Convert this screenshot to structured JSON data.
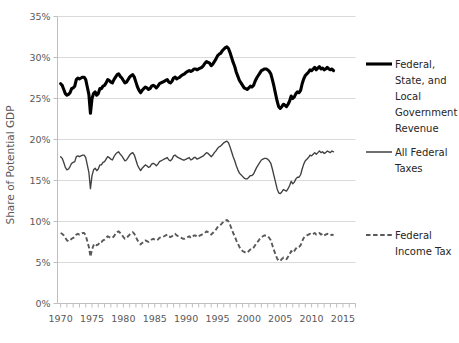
{
  "chart_data": {
    "type": "line",
    "title": "",
    "subtitle": "",
    "xlabel": "",
    "ylabel": "Share of Potential GDP",
    "xlim": [
      1969.5,
      2017.0
    ],
    "ylim": [
      0,
      35
    ],
    "ytick_labels": [
      "0%",
      "5%",
      "10%",
      "15%",
      "20%",
      "25%",
      "30%",
      "35%"
    ],
    "ytick_values": [
      0,
      5,
      10,
      15,
      20,
      25,
      30,
      35
    ],
    "xtick_labels": [
      "1970",
      "1975",
      "1980",
      "1985",
      "1990",
      "1995",
      "2000",
      "2005",
      "2010",
      "2015"
    ],
    "xtick_values": [
      1970,
      1975,
      1980,
      1985,
      1990,
      1995,
      2000,
      2005,
      2010,
      2015
    ],
    "minor_xticks_interval": 1,
    "grid": "horizontal",
    "legend_position": "right",
    "x_start": 1970,
    "x_step": 0.25,
    "series": [
      {
        "name": "Federal, State, and Local Government Revenue",
        "legend_label": "Federal,\nState, and\nLocal\nGovernment\nRevenue",
        "style": "solid-thick",
        "color": "#000000",
        "values": [
          26.8,
          26.6,
          26.1,
          25.6,
          25.4,
          25.5,
          25.7,
          26.2,
          26.3,
          26.5,
          27.3,
          27.5,
          27.4,
          27.5,
          27.6,
          27.6,
          27.3,
          26.4,
          25.5,
          23.2,
          25.0,
          25.6,
          25.8,
          25.4,
          25.6,
          26.2,
          26.2,
          26.5,
          26.6,
          26.9,
          27.3,
          27.2,
          27.0,
          26.9,
          27.3,
          27.6,
          27.9,
          28.0,
          27.7,
          27.5,
          27.2,
          26.9,
          27.0,
          27.3,
          27.6,
          27.8,
          27.9,
          27.6,
          27.0,
          26.4,
          26.0,
          25.7,
          26.0,
          26.2,
          26.4,
          26.3,
          26.1,
          26.2,
          26.5,
          26.6,
          26.5,
          26.3,
          26.5,
          26.8,
          26.9,
          27.0,
          27.1,
          27.2,
          27.3,
          27.0,
          26.9,
          27.1,
          27.5,
          27.6,
          27.4,
          27.5,
          27.6,
          27.8,
          27.9,
          28.0,
          28.2,
          28.3,
          28.4,
          28.3,
          28.4,
          28.6,
          28.6,
          28.5,
          28.6,
          28.7,
          28.8,
          29.0,
          29.3,
          29.5,
          29.4,
          29.3,
          29.0,
          29.2,
          29.5,
          29.8,
          30.2,
          30.4,
          30.5,
          30.8,
          31.0,
          31.2,
          31.3,
          31.1,
          30.6,
          30.0,
          29.4,
          28.9,
          28.2,
          27.7,
          27.2,
          26.9,
          26.6,
          26.3,
          26.2,
          26.1,
          26.3,
          26.5,
          26.4,
          26.6,
          27.1,
          27.5,
          27.8,
          28.1,
          28.4,
          28.5,
          28.6,
          28.6,
          28.5,
          28.3,
          28.0,
          27.3,
          26.5,
          25.6,
          24.7,
          24.0,
          23.8,
          24.0,
          24.3,
          24.2,
          24.0,
          24.3,
          24.7,
          25.3,
          25.0,
          25.2,
          25.6,
          25.8,
          25.7,
          26.0,
          26.8,
          27.4,
          27.8,
          28.0,
          28.2,
          28.5,
          28.4,
          28.6,
          28.8,
          28.5,
          28.7,
          28.9,
          28.6,
          28.7,
          28.5,
          28.6,
          28.8,
          28.6,
          28.5,
          28.6,
          28.4
        ]
      },
      {
        "name": "All Federal Taxes",
        "legend_label": "All Federal\nTaxes",
        "style": "solid-thin",
        "color": "#404040",
        "values": [
          17.9,
          17.7,
          17.2,
          16.6,
          16.3,
          16.4,
          16.7,
          17.1,
          17.2,
          17.3,
          17.9,
          18.0,
          17.9,
          18.0,
          18.1,
          18.1,
          17.8,
          16.9,
          16.0,
          14.0,
          15.6,
          16.3,
          16.5,
          16.2,
          16.4,
          16.9,
          16.9,
          17.2,
          17.3,
          17.6,
          17.9,
          17.8,
          17.6,
          17.5,
          17.9,
          18.2,
          18.4,
          18.5,
          18.2,
          18.0,
          17.7,
          17.4,
          17.5,
          17.8,
          18.1,
          18.3,
          18.4,
          18.1,
          17.5,
          16.9,
          16.5,
          16.2,
          16.5,
          16.7,
          16.9,
          16.8,
          16.6,
          16.7,
          17.0,
          17.1,
          17.0,
          16.8,
          17.0,
          17.3,
          17.4,
          17.5,
          17.6,
          17.7,
          17.8,
          17.5,
          17.4,
          17.6,
          18.0,
          18.1,
          17.9,
          17.8,
          17.7,
          17.6,
          17.5,
          17.5,
          17.6,
          17.7,
          17.8,
          17.5,
          17.6,
          17.8,
          17.8,
          17.6,
          17.7,
          17.8,
          17.9,
          18.0,
          18.2,
          18.4,
          18.3,
          18.1,
          17.9,
          18.1,
          18.4,
          18.6,
          18.9,
          19.1,
          19.2,
          19.4,
          19.6,
          19.7,
          19.8,
          19.6,
          19.1,
          18.5,
          17.9,
          17.4,
          16.8,
          16.3,
          15.9,
          15.7,
          15.5,
          15.3,
          15.2,
          15.2,
          15.4,
          15.6,
          15.6,
          15.8,
          16.2,
          16.6,
          16.9,
          17.2,
          17.5,
          17.6,
          17.7,
          17.7,
          17.6,
          17.4,
          17.1,
          16.4,
          15.6,
          14.8,
          14.0,
          13.5,
          13.4,
          13.6,
          13.9,
          13.8,
          13.7,
          14.0,
          14.4,
          14.9,
          14.6,
          14.8,
          15.2,
          15.4,
          15.4,
          15.7,
          16.4,
          17.0,
          17.4,
          17.6,
          17.8,
          18.1,
          18.0,
          18.2,
          18.4,
          18.2,
          18.4,
          18.6,
          18.4,
          18.5,
          18.3,
          18.4,
          18.6,
          18.5,
          18.4,
          18.6,
          18.5
        ]
      },
      {
        "name": "Federal Income Tax",
        "legend_label": "Federal\nIncome Tax",
        "style": "dashed",
        "color": "#595959",
        "values": [
          8.6,
          8.5,
          8.3,
          8.0,
          7.7,
          7.6,
          7.7,
          7.9,
          8.0,
          8.1,
          8.4,
          8.5,
          8.4,
          8.5,
          8.6,
          8.6,
          8.3,
          7.6,
          6.9,
          5.7,
          6.6,
          7.1,
          7.3,
          7.1,
          7.2,
          7.5,
          7.5,
          7.7,
          7.8,
          8.0,
          8.2,
          8.1,
          8.0,
          8.0,
          8.2,
          8.5,
          8.7,
          8.8,
          8.6,
          8.4,
          8.1,
          7.9,
          8.0,
          8.2,
          8.4,
          8.6,
          8.7,
          8.5,
          8.1,
          7.7,
          7.4,
          7.2,
          7.4,
          7.5,
          7.7,
          7.6,
          7.5,
          7.6,
          7.8,
          7.9,
          7.8,
          7.7,
          7.8,
          8.0,
          8.1,
          8.1,
          8.2,
          8.3,
          8.4,
          8.2,
          8.1,
          8.2,
          8.4,
          8.5,
          8.3,
          8.2,
          8.1,
          8.0,
          7.9,
          7.9,
          8.0,
          8.1,
          8.2,
          8.0,
          8.1,
          8.3,
          8.3,
          8.1,
          8.2,
          8.3,
          8.4,
          8.5,
          8.6,
          8.8,
          8.7,
          8.6,
          8.4,
          8.6,
          8.8,
          9.0,
          9.3,
          9.5,
          9.6,
          9.8,
          10.0,
          10.1,
          10.2,
          10.0,
          9.6,
          9.1,
          8.6,
          8.2,
          7.7,
          7.3,
          6.9,
          6.6,
          6.4,
          6.3,
          6.2,
          6.2,
          6.4,
          6.6,
          6.6,
          6.8,
          7.1,
          7.4,
          7.6,
          7.9,
          8.1,
          8.2,
          8.3,
          8.3,
          8.2,
          8.0,
          7.7,
          7.1,
          6.5,
          6.0,
          5.5,
          5.2,
          5.2,
          5.4,
          5.6,
          5.5,
          5.4,
          5.7,
          6.0,
          6.4,
          6.2,
          6.4,
          6.7,
          6.9,
          6.9,
          7.1,
          7.6,
          8.0,
          8.2,
          8.3,
          8.4,
          8.5,
          8.4,
          8.5,
          8.6,
          8.4,
          8.5,
          8.6,
          8.4,
          8.5,
          8.3,
          8.4,
          8.5,
          8.4,
          8.3,
          8.4,
          8.3
        ]
      }
    ]
  },
  "legend": {
    "items": [
      {
        "label_lines": [
          "Federal,",
          "State, and",
          "Local",
          "Government",
          "Revenue"
        ],
        "marker": "solid-thick-line-icon"
      },
      {
        "label_lines": [
          "All Federal",
          "Taxes"
        ],
        "marker": "solid-thin-line-icon"
      },
      {
        "label_lines": [
          "Federal",
          "Income Tax"
        ],
        "marker": "dashed-line-icon"
      }
    ]
  },
  "axes": {
    "y_title": "Share of Potential GDP"
  }
}
